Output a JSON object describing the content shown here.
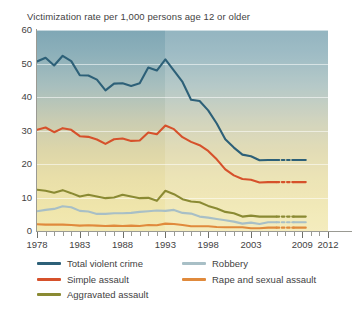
{
  "chart_data": {
    "type": "line",
    "title": "Victimization rate per 1,000 persons age 12 or older",
    "xlabel": "",
    "ylabel": "",
    "ylim": [
      0,
      60
    ],
    "ytick_step": 10,
    "yticks": [
      "0",
      "10",
      "20",
      "30",
      "40",
      "50",
      "60"
    ],
    "xlim": [
      1978,
      2012
    ],
    "xticks_labeled": [
      "1978",
      "1983",
      "1988",
      "1993",
      "1998",
      "2003",
      "2009",
      "2012"
    ],
    "xtick_labeled_years": [
      1978,
      1983,
      1988,
      1993,
      1998,
      2003,
      2009,
      2012
    ],
    "grid": "horizontal",
    "legend_position": "below",
    "data_end_year": 2010,
    "shaded_break_year": 1993,
    "x": [
      1978,
      1979,
      1980,
      1981,
      1982,
      1983,
      1984,
      1985,
      1986,
      1987,
      1988,
      1989,
      1990,
      1991,
      1992,
      1993,
      1994,
      1995,
      1996,
      1997,
      1998,
      1999,
      2000,
      2001,
      2002,
      2003,
      2004,
      2005,
      2006,
      2007,
      2008,
      2009,
      2010
    ],
    "series": [
      {
        "name": "Total violent crime",
        "color": "#2d6078",
        "values": [
          50.6,
          51.7,
          49.4,
          52.3,
          50.7,
          46.5,
          46.4,
          45.2,
          42.0,
          44.0,
          44.1,
          43.3,
          44.1,
          48.8,
          47.9,
          51.2,
          47.9,
          44.5,
          39.2,
          38.8,
          36.0,
          32.1,
          27.4,
          24.9,
          22.8,
          22.3,
          21.1,
          21.2,
          25.0,
          20.7,
          19.3,
          17.1,
          19.3
        ],
        "dash_segment_years": [
          2006,
          2008
        ]
      },
      {
        "name": "Simple assault",
        "color": "#d6512b",
        "values": [
          30.2,
          30.9,
          29.5,
          30.7,
          30.2,
          28.3,
          28.1,
          27.3,
          26.0,
          27.4,
          27.6,
          26.9,
          27.0,
          29.4,
          28.9,
          31.5,
          30.4,
          28.0,
          26.6,
          25.6,
          23.9,
          21.4,
          18.4,
          16.6,
          15.5,
          15.3,
          14.5,
          14.6,
          17.2,
          14.1,
          13.3,
          12.9,
          13.4
        ],
        "dash_segment_years": [
          2006,
          2008
        ]
      },
      {
        "name": "Aggravated assault",
        "color": "#8a8a33",
        "values": [
          12.3,
          12.0,
          11.4,
          12.2,
          11.3,
          10.3,
          10.8,
          10.3,
          9.8,
          10.0,
          10.8,
          10.3,
          9.8,
          9.9,
          9.0,
          12.0,
          11.0,
          9.5,
          8.8,
          8.6,
          7.5,
          6.7,
          5.7,
          5.3,
          4.3,
          4.6,
          4.3,
          4.3,
          5.2,
          3.9,
          3.3,
          3.2,
          3.8
        ],
        "dash_segment_years": [
          2006,
          2008
        ]
      },
      {
        "name": "Robbery",
        "color": "#a8bfc6",
        "values": [
          5.9,
          6.3,
          6.6,
          7.4,
          7.1,
          6.0,
          5.8,
          5.1,
          5.1,
          5.3,
          5.3,
          5.4,
          5.7,
          5.9,
          6.1,
          6.0,
          6.3,
          5.4,
          5.2,
          4.3,
          4.0,
          3.6,
          3.2,
          2.8,
          2.2,
          2.5,
          2.1,
          2.6,
          2.6,
          2.4,
          2.2,
          2.1,
          2.4
        ],
        "dash_segment_years": [
          2006,
          2008
        ]
      },
      {
        "name": "Rape and sexual assault",
        "color": "#e08a3c",
        "values": [
          2.0,
          1.9,
          1.9,
          1.9,
          1.8,
          1.6,
          1.7,
          1.6,
          1.5,
          1.6,
          1.5,
          1.6,
          1.5,
          1.8,
          1.7,
          2.2,
          2.1,
          1.8,
          1.4,
          1.4,
          1.4,
          1.2,
          1.1,
          1.1,
          1.1,
          0.8,
          0.8,
          1.0,
          1.1,
          0.9,
          0.8,
          0.8,
          1.2
        ],
        "dash_segment_years": [
          2006,
          2008
        ]
      }
    ]
  },
  "legend": {
    "entries": [
      {
        "label": "Total violent crime",
        "color": "#2d6078",
        "column": 1
      },
      {
        "label": "Robbery",
        "color": "#a8bfc6",
        "column": 2
      },
      {
        "label": "Simple assault",
        "color": "#d6512b",
        "column": 1
      },
      {
        "label": "Rape and sexual assault",
        "color": "#e08a3c",
        "column": 2
      },
      {
        "label": "Aggravated assault",
        "color": "#8a8a33",
        "column": 1
      }
    ]
  }
}
